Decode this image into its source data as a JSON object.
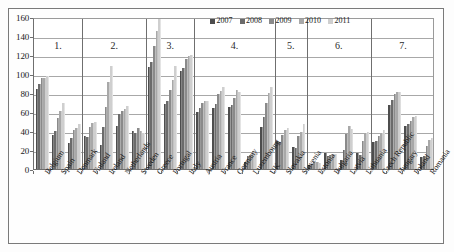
{
  "chart_data": {
    "type": "bar",
    "title": "",
    "subtitle": "",
    "xlabel": "",
    "ylabel": "",
    "ylim": [
      0,
      160
    ],
    "ytick_step": 20,
    "yticks": [
      "0",
      "20",
      "40",
      "60",
      "80",
      "100",
      "120",
      "140",
      "160"
    ],
    "grid": true,
    "legend_position": "top-right",
    "categories": [
      "Belgium",
      "Spain",
      "Denmark",
      "Finland",
      "Ireland",
      "Netherlands",
      "Sweden",
      "Greece",
      "Portugal",
      "Italy",
      "Austria",
      "France",
      "Germany",
      "Luxembourg",
      "UK",
      "Slovakia",
      "Slovenia",
      "Estonia",
      "Bulgaria",
      "Latvia",
      "Lithuania",
      "Czech Republic",
      "Hungary",
      "Poland",
      "Romania"
    ],
    "series": [
      {
        "name": "2007",
        "color": "#4d4d4d",
        "values": [
          84,
          36,
          27,
          35,
          25,
          45,
          40,
          107,
          68,
          103,
          60,
          64,
          65,
          7,
          44,
          29,
          23,
          4,
          17,
          9,
          17,
          28,
          67,
          45,
          13
        ]
      },
      {
        "name": "2008",
        "color": "#6b6b6b",
        "values": [
          89,
          40,
          33,
          34,
          44,
          58,
          38,
          113,
          72,
          106,
          64,
          68,
          67,
          14,
          55,
          28,
          22,
          5,
          14,
          20,
          15,
          29,
          73,
          47,
          14
        ]
      },
      {
        "name": "2009",
        "color": "#8a8a8a",
        "values": [
          96,
          54,
          41,
          44,
          65,
          61,
          43,
          129,
          83,
          116,
          70,
          79,
          75,
          15,
          70,
          36,
          35,
          7,
          15,
          37,
          29,
          35,
          79,
          51,
          24
        ]
      },
      {
        "name": "2010",
        "color": "#a8a8a8",
        "values": [
          96,
          61,
          43,
          48,
          92,
          63,
          40,
          145,
          94,
          119,
          72,
          82,
          83,
          19,
          80,
          41,
          39,
          7,
          16,
          45,
          38,
          38,
          81,
          55,
          31
        ]
      },
      {
        "name": "2011",
        "color": "#cfcfcf",
        "values": [
          98,
          69,
          47,
          49,
          108,
          66,
          38,
          165,
          108,
          120,
          72,
          86,
          81,
          18,
          86,
          43,
          47,
          6,
          16,
          42,
          39,
          41,
          81,
          56,
          33
        ]
      }
    ],
    "group_dividers": [
      {
        "label": "1.",
        "categories": [
          "Belgium",
          "Spain",
          "Denmark"
        ]
      },
      {
        "label": "2.",
        "categories": [
          "Finland",
          "Ireland",
          "Netherlands",
          "Sweden"
        ]
      },
      {
        "label": "3.",
        "categories": [
          "Greece",
          "Portugal",
          "Italy"
        ]
      },
      {
        "label": "4.",
        "categories": [
          "Austria",
          "France",
          "Germany",
          "Luxembourg",
          "UK"
        ]
      },
      {
        "label": "5.",
        "categories": [
          "Slovakia",
          "Slovenia"
        ]
      },
      {
        "label": "6.",
        "categories": [
          "Estonia",
          "Bulgaria",
          "Latvia",
          "Lithuania"
        ]
      },
      {
        "label": "7.",
        "categories": [
          "Czech Republic",
          "Hungary",
          "Poland",
          "Romania"
        ]
      }
    ]
  },
  "legend": {
    "items": [
      {
        "label": "2007",
        "color": "#4d4d4d"
      },
      {
        "label": "2008",
        "color": "#6b6b6b"
      },
      {
        "label": "2009",
        "color": "#8a8a8a"
      },
      {
        "label": "2010",
        "color": "#a8a8a8"
      },
      {
        "label": "2011",
        "color": "#cfcfcf"
      }
    ]
  }
}
